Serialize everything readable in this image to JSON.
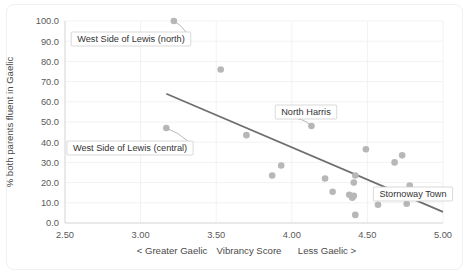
{
  "chart_data": {
    "type": "scatter",
    "title": "",
    "subtitle": "",
    "xlabel": "Vibrancy Score",
    "xlabel_left_note": "< Greater Gaelic",
    "xlabel_right_note": "Less Gaelic >",
    "ylabel": "% both parents fluent in Gaelic",
    "xlim": [
      2.5,
      5.0
    ],
    "ylim": [
      0.0,
      100.0
    ],
    "xticks": [
      "2.50",
      "3.00",
      "3.50",
      "4.00",
      "4.50",
      "5.00"
    ],
    "xtick_values": [
      2.5,
      3.0,
      3.5,
      4.0,
      4.5,
      5.0
    ],
    "yticks": [
      "0.0",
      "10.0",
      "20.0",
      "30.0",
      "40.0",
      "50.0",
      "60.0",
      "70.0",
      "80.0",
      "90.0",
      "100.0"
    ],
    "ytick_values": [
      0,
      10,
      20,
      30,
      40,
      50,
      60,
      70,
      80,
      90,
      100
    ],
    "grid": true,
    "legend": "none",
    "marker_color": "#b7b7b7",
    "trendline_color": "#6e6e6e",
    "points": [
      {
        "x": 3.22,
        "y": 100.0,
        "label": "West Side of Lewis (north)"
      },
      {
        "x": 3.53,
        "y": 76.0,
        "label": ""
      },
      {
        "x": 3.17,
        "y": 47.0,
        "label": "West Side of Lewis (central)"
      },
      {
        "x": 4.13,
        "y": 48.0,
        "label": "North Harris"
      },
      {
        "x": 3.7,
        "y": 43.5,
        "label": ""
      },
      {
        "x": 3.93,
        "y": 28.5,
        "label": ""
      },
      {
        "x": 3.87,
        "y": 23.5,
        "label": ""
      },
      {
        "x": 4.22,
        "y": 22.0,
        "label": ""
      },
      {
        "x": 4.49,
        "y": 36.5,
        "label": ""
      },
      {
        "x": 4.73,
        "y": 33.5,
        "label": ""
      },
      {
        "x": 4.68,
        "y": 30.0,
        "label": ""
      },
      {
        "x": 4.42,
        "y": 23.5,
        "label": ""
      },
      {
        "x": 4.41,
        "y": 20.0,
        "label": ""
      },
      {
        "x": 4.27,
        "y": 15.5,
        "label": ""
      },
      {
        "x": 4.38,
        "y": 14.0,
        "label": ""
      },
      {
        "x": 4.41,
        "y": 13.5,
        "label": ""
      },
      {
        "x": 4.4,
        "y": 12.5,
        "label": ""
      },
      {
        "x": 4.78,
        "y": 18.5,
        "label": ""
      },
      {
        "x": 4.57,
        "y": 9.0,
        "label": ""
      },
      {
        "x": 4.76,
        "y": 9.5,
        "label": "Stornoway Town"
      },
      {
        "x": 4.42,
        "y": 4.0,
        "label": ""
      }
    ],
    "trendline": {
      "x1": 3.17,
      "y1": 64.0,
      "x2": 5.0,
      "y2": 5.5
    },
    "annotations": [
      {
        "text": "West Side of Lewis (north)",
        "target_x": 3.22,
        "target_y": 100.0
      },
      {
        "text": "West Side of Lewis (central)",
        "target_x": 3.17,
        "target_y": 47.0
      },
      {
        "text": "North Harris",
        "target_x": 4.13,
        "target_y": 48.0
      },
      {
        "text": "Stornoway Town",
        "target_x": 4.76,
        "target_y": 9.5
      }
    ]
  }
}
